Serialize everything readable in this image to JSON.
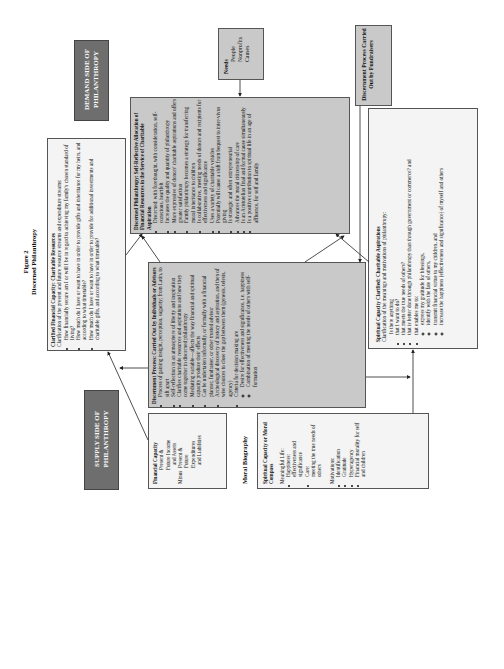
{
  "figure": {
    "number": "Figure 2",
    "title": "Discerned Philanthropy"
  },
  "demand_side": {
    "label_line1": "DEMAND SIDE OF",
    "label_line2": "PHILANTHROPY"
  },
  "supply_side": {
    "label_line1": "SUPPLY SIDE OF",
    "label_line2": "PHILANTHROPY"
  },
  "clarified_financial": {
    "title": "Clarified Financial Capacity:  Charitable Resources",
    "intro": "Clarification of the present and future resource streams and expenditure streams:",
    "items": [
      "How financially secure am I or will I be in regard to achieving my family's chosen standard of living?",
      "How much do I have or want to have in order to provide gifts and inheritance for my heirs, and according to what timetable?",
      "How much do I have or want to have in order to provide for additional investments and charitable gifts, and according to what timetable?"
    ]
  },
  "discerned_philanthropy": {
    "title": "Discerned Philanthropy:  Self-Reflective Allocation of Financial Resources in the Service of Charitable Aspiration",
    "items": [
      "Discerned: with forethought, with consideration, self-conscious, heartfelt",
      "Increases the quality and quantity of philanthropy",
      "More expressive of donors' charitable aspirations and offers greater satisfaction",
      "Family philanthropy becomes a strategy for transferring moral inheritance to children",
      "Is collaborative, meeting needs of donors and recipients for effectiveness and significance",
      "Uses a variety of charitable vehicles",
      "Potentially will cause a shift from bequest to inter-vivos giving",
      "Is strategic and often entrepreneurial",
      "Advances the moral citizenship of care",
      "Is an Aristotelian final and formal cause simultaneously",
      "Is a positive contribution to spiritual life in an age of affluence, for self and family"
    ]
  },
  "needs": {
    "title": "Needs",
    "items": [
      "People",
      "Nonprofits",
      "Causes"
    ]
  },
  "fundraisers": {
    "title": "Discernment Process Carried Out by Fundraisers"
  },
  "discernment_process": {
    "title": "Discernment Process: Carried Out by Individuals or Advisors",
    "items": [
      "Process of gaining insight, perception, sagacity; from Latin, to sift apart",
      "Self-reflection in an atmosphere of liberty and inspiration",
      "Clarifies charitable resources and aspirations and how they come together in discerned philanthropy",
      "Mediating variable—affects the way financial and spiritual capacity produce their effects",
      "Can be undertaken informally, or formally with a financial planner, fundraiser, or other trusted advisor",
      "Archeological discovery of history and aspiration, and then of wise choices to close the gap between them (genesis, telesis, agency)",
      "Criteria for decision making are"
    ],
    "criteria": [
      "Desire for effectiveness and significance, i.e. happiness",
      "Combination of meeting the needs of others with self-formation"
    ]
  },
  "spiritual_clarified": {
    "title": "Spiritual Capacity Clarified:  Charitable Aspirations",
    "intro": "Clarification of the meanings and motivations of philanthropy:",
    "lead": "Is there anything",
    "items": [
      "that I want to do?",
      "that meets the true needs of others?",
      "that is better done through philanthropy than through government or commerce? and",
      "that enables me to:"
    ],
    "sub_items": [
      "express my gratitude for blessings,",
      "identify with the fate of others,",
      "transmit financial virtue to my children, and",
      "increase the happiness (effectiveness and significance) of myself and others"
    ]
  },
  "financial_capacity": {
    "title": "Financial Capacity",
    "line1": "Present &",
    "line2": "Future Income",
    "line3": "and Assets",
    "minus": "Minus",
    "line4": "Present &",
    "line5": "Future",
    "line6": "Expenditures",
    "line7": "and Liabilities"
  },
  "moral_biography": {
    "label": "Moral Biography"
  },
  "spiritual_compass": {
    "title": "Spiritual Capacity or Moral Compass",
    "meaningful_label": "Meaningful Life:",
    "meaningful": [
      {
        "term": "Happiness:",
        "desc": "effectiveness and significance"
      },
      {
        "term": "Care:",
        "desc": "meeting the true needs of others"
      }
    ],
    "motivations_label": "Motivations:",
    "motivations": [
      "Identification",
      "Gratitude",
      "Hyperagency",
      "Financial morality for self and children"
    ]
  },
  "colors": {
    "gray_box": "#c9c9c9",
    "dark_box": "#6e6e6e",
    "light_box": "#f4f4f4"
  }
}
